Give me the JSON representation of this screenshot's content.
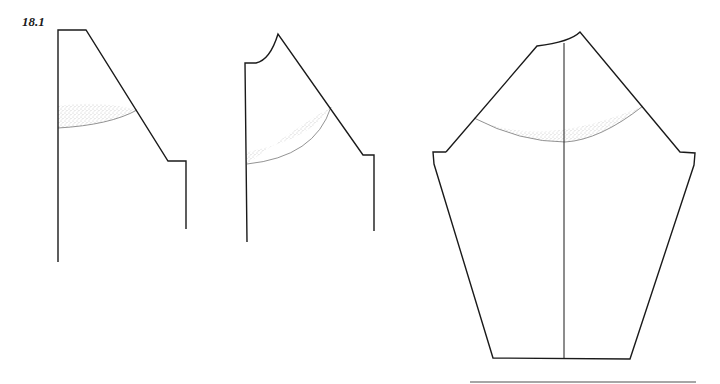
{
  "figure": {
    "label": "18.1",
    "stroke_color": "#1a1a1a",
    "shade_color": "#9a9a9a",
    "panels": [
      {
        "name": "back-bodice-piece",
        "description": "Pattern piece with straight left edge, sloped right edge, shaded curved band"
      },
      {
        "name": "front-bodice-piece",
        "description": "Pattern piece with curved neckline, sloped shoulder, shaded curved band"
      },
      {
        "name": "sleeve-piece",
        "description": "Combined sleeve/yoke piece with center line and shaded curved band"
      }
    ]
  }
}
